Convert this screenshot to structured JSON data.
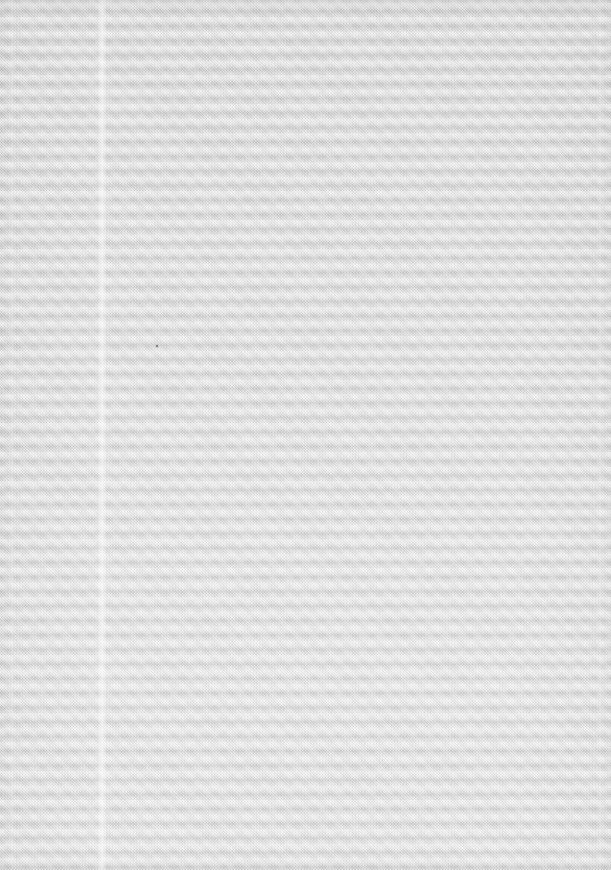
{
  "document": {
    "kind": "scanned-page",
    "content_type": "blank",
    "visible_text": "",
    "page_width_px": 611,
    "page_height_px": 870,
    "description": "Blank scanned sheet of paper with no printed text, figures, rules or page numbers"
  },
  "appearance": {
    "paper_tone_light": "#e6e6e6",
    "paper_tone_mid": "#dcdcdc",
    "paper_tone_dark": "#cdcdcd",
    "band_highlight": "#efefef",
    "band_shadow": "#c9c9c9",
    "edge_shadow": "#bdbdbd",
    "speck_color": "#6f6f6f"
  },
  "artifacts": {
    "horizontal_banding": {
      "name": "scanner-banding",
      "orientation": "horizontal",
      "period_px": 14.5,
      "count_approx": 60
    },
    "dither_weave": {
      "name": "halftone-dither-weave",
      "orientation": "diagonal",
      "period_px": 2
    },
    "vertical_streaks": [
      {
        "name": "primary-streak",
        "x_px": 97,
        "width_px": 10,
        "intensity": "faint-light"
      },
      {
        "name": "secondary-streak",
        "x_px": 8,
        "width_px": 8,
        "intensity": "very-faint"
      },
      {
        "name": "tertiary-streak",
        "x_px": 596,
        "width_px": 8,
        "intensity": "very-faint"
      }
    ],
    "specks": [
      {
        "name": "dust-speck",
        "x_px": 156,
        "y_px": 345,
        "size_px": 2
      }
    ],
    "vertical_gradient": {
      "name": "top-darker-bottom-lighter",
      "top_tone": "#d4d4d4",
      "bottom_tone": "#e3e3e3"
    }
  }
}
